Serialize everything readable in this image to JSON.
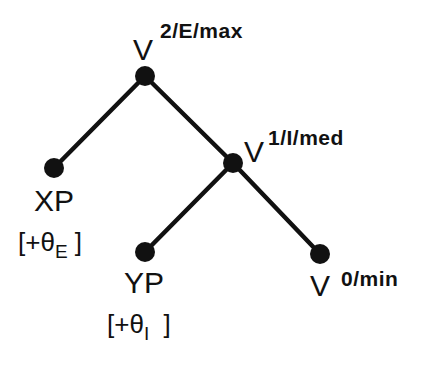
{
  "diagram": {
    "type": "tree",
    "nodes": [
      {
        "id": "v2",
        "label": "V",
        "superscript": "2/E/max",
        "x": 145,
        "y": 76
      },
      {
        "id": "xp",
        "label": "XP",
        "annotation": {
          "prefix": "[+θ",
          "subscript": "E",
          "suffix": "]"
        },
        "x": 54,
        "y": 168
      },
      {
        "id": "v1",
        "label": "V",
        "superscript": "1/I/med",
        "x": 233,
        "y": 163
      },
      {
        "id": "yp",
        "label": "YP",
        "annotation": {
          "prefix": "[+θ",
          "subscript": "I",
          "suffix": "]"
        },
        "x": 145,
        "y": 252
      },
      {
        "id": "v0",
        "label": "V",
        "superscript": "0/min",
        "x": 320,
        "y": 254
      }
    ],
    "edges": [
      {
        "from": "v2",
        "to": "xp"
      },
      {
        "from": "v2",
        "to": "v1"
      },
      {
        "from": "v1",
        "to": "yp"
      },
      {
        "from": "v1",
        "to": "v0"
      }
    ]
  }
}
